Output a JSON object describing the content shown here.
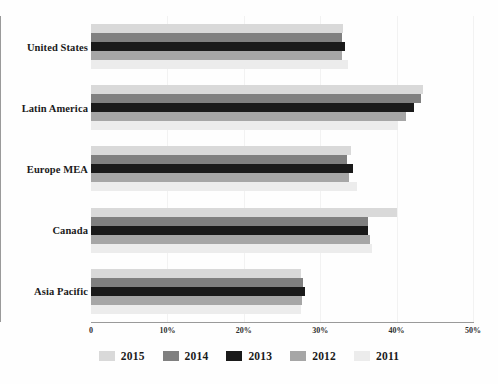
{
  "chart_data": {
    "type": "bar",
    "orientation": "horizontal",
    "title": "",
    "xlabel": "",
    "ylabel": "",
    "xlim": [
      0,
      50
    ],
    "xticks": [
      0,
      10,
      20,
      30,
      40,
      50
    ],
    "xtick_labels": [
      "0",
      "10%",
      "20%",
      "30%",
      "40%",
      "50%"
    ],
    "grid": true,
    "legend_position": "bottom",
    "categories": [
      "United States",
      "Latin America",
      "Europe MEA",
      "Canada",
      "Asia Pacific"
    ],
    "series": [
      {
        "name": "2015",
        "color": "#d9d9d9",
        "values": [
          33.0,
          43.5,
          34.0,
          40.0,
          27.5
        ]
      },
      {
        "name": "2014",
        "color": "#808080",
        "values": [
          32.8,
          43.2,
          33.5,
          36.3,
          27.8
        ]
      },
      {
        "name": "2013",
        "color": "#1a1a1a",
        "values": [
          33.2,
          42.3,
          34.3,
          36.3,
          28.0
        ]
      },
      {
        "name": "2012",
        "color": "#a6a6a6",
        "values": [
          32.8,
          41.2,
          33.8,
          36.5,
          27.6
        ]
      },
      {
        "name": "2011",
        "color": "#ececec",
        "values": [
          33.6,
          40.2,
          34.8,
          36.8,
          27.5
        ]
      }
    ]
  },
  "legend": {
    "items": [
      {
        "label": "2015",
        "color": "#d9d9d9"
      },
      {
        "label": "2014",
        "color": "#808080"
      },
      {
        "label": "2013",
        "color": "#1a1a1a"
      },
      {
        "label": "2012",
        "color": "#a6a6a6"
      },
      {
        "label": "2011",
        "color": "#ececec"
      }
    ]
  },
  "axis": {
    "line_color": "#9a9a9a",
    "grid_color": "#f2f2f2"
  }
}
